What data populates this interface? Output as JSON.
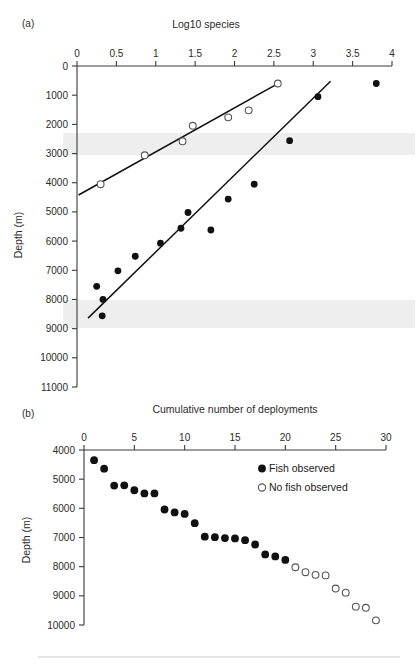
{
  "figure": {
    "background_color": "#ffffff",
    "ink_color": "#111111"
  },
  "panel_a": {
    "label": "(a)",
    "top_axis_title": "Log10 species",
    "y_axis_title": "Depth (m)",
    "x_ticks": [
      "0",
      "0.5",
      "1",
      "1.5",
      "2",
      "2.5",
      "3",
      "3.5",
      "4"
    ],
    "y_ticks": [
      "0",
      "1000",
      "2000",
      "3000",
      "4000",
      "5000",
      "6000",
      "7000",
      "8000",
      "9000",
      "10000",
      "11000"
    ]
  },
  "panel_b": {
    "label": "(b)",
    "top_axis_title": "Cumulative number of deployments",
    "y_axis_title": "Depth (m)",
    "x_ticks": [
      "0",
      "5",
      "10",
      "15",
      "20",
      "25",
      "30"
    ],
    "y_ticks": [
      "4000",
      "5000",
      "6000",
      "7000",
      "8000",
      "9000",
      "10000"
    ],
    "legend": [
      {
        "marker": "filled-circle",
        "label": "Fish observed"
      },
      {
        "marker": "open-circle",
        "label": "No fish observed"
      }
    ]
  },
  "chart_data": [
    {
      "type": "scatter",
      "panel": "a",
      "title": "Log10 species",
      "xlabel": "Log10 species",
      "ylabel": "Depth (m)",
      "xlim": [
        0,
        4
      ],
      "ylim": [
        11000,
        0
      ],
      "y_inverted": true,
      "grid": false,
      "legend": "none",
      "series": [
        {
          "name": "No fish observed",
          "marker": "open-circle",
          "points": [
            {
              "x": 0.3,
              "y": 4050
            },
            {
              "x": 0.86,
              "y": 3060
            },
            {
              "x": 1.34,
              "y": 2580
            },
            {
              "x": 1.47,
              "y": 2050
            },
            {
              "x": 1.92,
              "y": 1760
            },
            {
              "x": 2.18,
              "y": 1520
            },
            {
              "x": 2.55,
              "y": 600
            }
          ],
          "trend_line": {
            "x1": 0.02,
            "y1": 4420,
            "x2": 2.58,
            "y2": 560
          }
        },
        {
          "name": "Fish observed",
          "marker": "filled-circle",
          "points": [
            {
              "x": 0.32,
              "y": 8560
            },
            {
              "x": 0.33,
              "y": 8000
            },
            {
              "x": 0.25,
              "y": 7550
            },
            {
              "x": 0.52,
              "y": 7020
            },
            {
              "x": 0.74,
              "y": 6520
            },
            {
              "x": 1.06,
              "y": 6070
            },
            {
              "x": 1.32,
              "y": 5560
            },
            {
              "x": 1.41,
              "y": 5020
            },
            {
              "x": 1.7,
              "y": 5620
            },
            {
              "x": 1.92,
              "y": 4560
            },
            {
              "x": 2.25,
              "y": 4050
            },
            {
              "x": 2.7,
              "y": 2560
            },
            {
              "x": 3.06,
              "y": 1050
            },
            {
              "x": 3.8,
              "y": 600
            }
          ],
          "trend_line": {
            "x1": 0.14,
            "y1": 8640,
            "x2": 3.22,
            "y2": 520
          }
        }
      ]
    },
    {
      "type": "scatter",
      "panel": "b",
      "title": "Cumulative number of deployments",
      "xlabel": "Cumulative number of deployments",
      "ylabel": "Depth (m)",
      "xlim": [
        0,
        30
      ],
      "ylim": [
        10200,
        4000
      ],
      "y_inverted": true,
      "grid": false,
      "legend": "top-right",
      "series": [
        {
          "name": "Fish observed",
          "marker": "filled-circle",
          "points": [
            {
              "x": 1.0,
              "y": 4350
            },
            {
              "x": 2.0,
              "y": 4640
            },
            {
              "x": 3.0,
              "y": 5220
            },
            {
              "x": 4.0,
              "y": 5210
            },
            {
              "x": 5.0,
              "y": 5380
            },
            {
              "x": 6.0,
              "y": 5490
            },
            {
              "x": 7.0,
              "y": 5490
            },
            {
              "x": 8.0,
              "y": 6040
            },
            {
              "x": 9.0,
              "y": 6140
            },
            {
              "x": 10.0,
              "y": 6190
            },
            {
              "x": 11.0,
              "y": 6510
            },
            {
              "x": 12.0,
              "y": 6970
            },
            {
              "x": 13.0,
              "y": 6990
            },
            {
              "x": 14.0,
              "y": 7020
            },
            {
              "x": 15.0,
              "y": 7030
            },
            {
              "x": 16.0,
              "y": 7090
            },
            {
              "x": 17.0,
              "y": 7240
            },
            {
              "x": 18.0,
              "y": 7580
            },
            {
              "x": 19.0,
              "y": 7650
            },
            {
              "x": 20.0,
              "y": 7770
            }
          ]
        },
        {
          "name": "No fish observed",
          "marker": "open-circle",
          "points": [
            {
              "x": 21.0,
              "y": 8020
            },
            {
              "x": 22.0,
              "y": 8190
            },
            {
              "x": 23.0,
              "y": 8280
            },
            {
              "x": 24.0,
              "y": 8300
            },
            {
              "x": 25.0,
              "y": 8750
            },
            {
              "x": 26.0,
              "y": 8890
            },
            {
              "x": 27.0,
              "y": 9370
            },
            {
              "x": 28.0,
              "y": 9410
            },
            {
              "x": 29.0,
              "y": 9840
            }
          ]
        }
      ]
    }
  ]
}
